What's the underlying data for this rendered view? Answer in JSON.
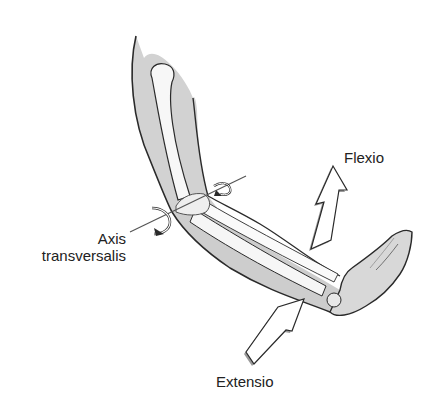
{
  "figure": {
    "labels": {
      "flexio": "Flexio",
      "axis_line1": "Axis",
      "axis_line2": "transversalis",
      "extensio": "Extensio"
    },
    "colors": {
      "background": "#ffffff",
      "skin_fill": "#cfcfcf",
      "skin_light": "#e4e4e4",
      "bone_fill": "#f7f7f7",
      "outline": "#2a2a2a",
      "arrow_fill": "#ffffff",
      "arrow_shadow": "#9a9a9a",
      "text": "#222222"
    },
    "elements": [
      "upper-arm",
      "humerus",
      "elbow-joint",
      "forearm",
      "radius",
      "ulna",
      "hand",
      "transverse-axis-line",
      "rotation-arrow-left",
      "rotation-arrow-right",
      "flexion-arrow",
      "extension-arrow"
    ]
  }
}
